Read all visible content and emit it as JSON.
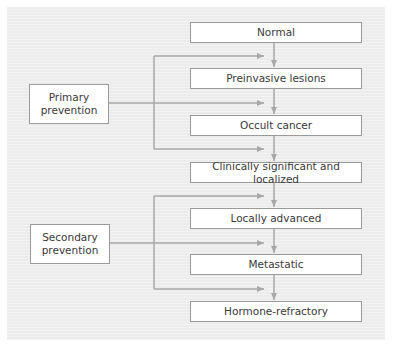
{
  "stages": [
    {
      "label": "Normal",
      "top": 22
    },
    {
      "label": "Preinvasive lesions",
      "top": 68
    },
    {
      "label": "Occult cancer",
      "top": 115
    },
    {
      "label": "Clinically significant and localized",
      "top": 162
    },
    {
      "label": "Locally advanced",
      "top": 208
    },
    {
      "label": "Metastatic",
      "top": 254
    },
    {
      "label": "Hormone-refractory",
      "top": 301
    }
  ],
  "prevention": {
    "primary": {
      "line1": "Primary",
      "line2": "prevention"
    },
    "secondary": {
      "line1": "Secondary",
      "line2": "prevention"
    }
  },
  "colors": {
    "panel": "#ececec",
    "line": "#a8a8a8",
    "box_border": "#9a9a9a",
    "text": "#3a3a3a"
  }
}
